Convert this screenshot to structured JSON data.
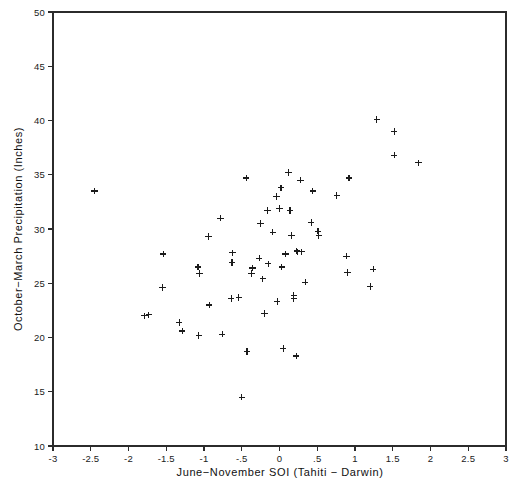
{
  "chart_data": {
    "type": "scatter",
    "title": "",
    "xlabel": "June−November SOI (Tahiti − Darwin)",
    "ylabel": "October−March Precipitation (Inches)",
    "xlim": [
      -3,
      3
    ],
    "ylim": [
      10,
      50
    ],
    "grid": false,
    "legend": null,
    "marker": "plus",
    "marker_color": "#1b1b1b",
    "xticks": [
      -3,
      -2.5,
      -2,
      -1.5,
      -1,
      -0.5,
      0,
      0.5,
      1,
      1.5,
      2,
      2.5,
      3
    ],
    "xticklabels": [
      "-3",
      "-2.5",
      "-2",
      "-1.5",
      "-1",
      "-.5",
      "0",
      ".5",
      "1",
      "1.5",
      "2",
      "2.5",
      "3"
    ],
    "yticks": [
      10,
      15,
      20,
      25,
      30,
      35,
      40,
      45,
      50
    ],
    "yticklabels": [
      "10",
      "15",
      "20",
      "25",
      "30",
      "35",
      "40",
      "45",
      "50"
    ],
    "points": [
      [
        -2.45,
        33.5
      ],
      [
        -1.79,
        22.0
      ],
      [
        -1.73,
        22.1
      ],
      [
        -1.54,
        27.7
      ],
      [
        -1.55,
        24.6
      ],
      [
        -1.33,
        21.4
      ],
      [
        -1.29,
        20.6
      ],
      [
        -1.08,
        26.5
      ],
      [
        -1.06,
        25.9
      ],
      [
        -1.07,
        20.2
      ],
      [
        -0.94,
        29.3
      ],
      [
        -0.93,
        23.0
      ],
      [
        -0.78,
        31.0
      ],
      [
        -0.76,
        20.3
      ],
      [
        -0.62,
        27.8
      ],
      [
        -0.63,
        26.9
      ],
      [
        -0.64,
        23.6
      ],
      [
        -0.54,
        23.7
      ],
      [
        -0.5,
        14.5
      ],
      [
        -0.44,
        34.7
      ],
      [
        -0.43,
        18.7
      ],
      [
        -0.36,
        26.4
      ],
      [
        -0.37,
        25.9
      ],
      [
        -0.27,
        27.3
      ],
      [
        -0.25,
        30.5
      ],
      [
        -0.22,
        25.4
      ],
      [
        -0.2,
        22.2
      ],
      [
        -0.16,
        31.7
      ],
      [
        -0.15,
        26.8
      ],
      [
        -0.09,
        29.7
      ],
      [
        -0.04,
        33.0
      ],
      [
        -0.03,
        23.3
      ],
      [
        0.0,
        31.9
      ],
      [
        0.02,
        33.8
      ],
      [
        0.03,
        26.5
      ],
      [
        0.05,
        19.0
      ],
      [
        0.08,
        27.7
      ],
      [
        0.12,
        35.2
      ],
      [
        0.14,
        31.7
      ],
      [
        0.16,
        29.4
      ],
      [
        0.19,
        23.9
      ],
      [
        0.19,
        23.6
      ],
      [
        0.23,
        28.0
      ],
      [
        0.24,
        27.9
      ],
      [
        0.22,
        18.3
      ],
      [
        0.28,
        34.5
      ],
      [
        0.29,
        27.9
      ],
      [
        0.34,
        25.1
      ],
      [
        0.42,
        30.6
      ],
      [
        0.44,
        33.5
      ],
      [
        0.51,
        29.8
      ],
      [
        0.52,
        29.4
      ],
      [
        0.76,
        33.1
      ],
      [
        0.89,
        27.5
      ],
      [
        0.9,
        26.0
      ],
      [
        0.92,
        34.7
      ],
      [
        1.2,
        24.7
      ],
      [
        1.24,
        26.3
      ],
      [
        1.29,
        40.1
      ],
      [
        1.52,
        39.0
      ],
      [
        1.52,
        36.8
      ],
      [
        1.84,
        36.1
      ]
    ]
  },
  "axes": {
    "x_title": "June−November SOI (Tahiti − Darwin)",
    "y_title": "October−March Precipitation (Inches)"
  }
}
